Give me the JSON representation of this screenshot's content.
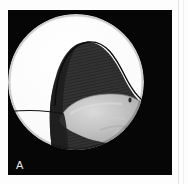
{
  "figure": {
    "panel_label": "A",
    "modality": "endoscopic-photograph",
    "colors": {
      "page_background": "#fdfdfd",
      "plate_background": "#060606",
      "field_white": "#fbfbfb",
      "dark_tissue": "#2f2f2f",
      "dark_tissue_shadow": "#1d1d1d",
      "gray_structure": "#b9b9b9",
      "gray_structure_light": "#d2d2d2",
      "gray_structure_shadow": "#9a9a9a",
      "outline_line": "#111111",
      "label_text": "#e8e8e8",
      "page_edge": "#e2e2e2"
    },
    "geometry": {
      "plate": {
        "x": 8,
        "y": 10,
        "width": 164,
        "height": 165
      },
      "field_circle": {
        "cx": 68,
        "cy": 72,
        "r": 68
      }
    }
  },
  "elements": {
    "field_of_view": "circular-endoscopic-field",
    "dark_tissue_mass": "dark-hatched-tissue-mass",
    "gray_structure": "central-gray-tissue-structure",
    "horizon_line_left": "thin-curved-line-left",
    "horizon_line_right": "thin-curved-line-right",
    "specular_dot": "small-dark-specular-dot"
  }
}
